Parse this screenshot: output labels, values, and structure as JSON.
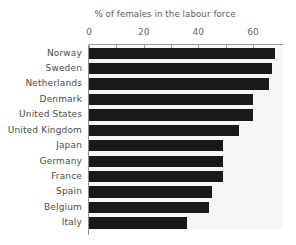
{
  "chart_data": {
    "type": "bar",
    "orientation": "horizontal",
    "title": "% of females in the labour force",
    "xlabel": "",
    "ylabel": "",
    "categories": [
      "Norway",
      "Sweden",
      "Netherlands",
      "Denmark",
      "United States",
      "United Kingdom",
      "Japan",
      "Germany",
      "France",
      "Spain",
      "Belgium",
      "Italy"
    ],
    "values": [
      68,
      67,
      66,
      60,
      60,
      55,
      49,
      49,
      49,
      45,
      44,
      36
    ],
    "xlim": [
      0,
      71
    ],
    "xticks": [
      0,
      20,
      40,
      60
    ],
    "xtick_labels": [
      "0",
      "20",
      "40",
      "60"
    ],
    "minor_xticks": [
      10,
      30,
      50
    ],
    "grid": false,
    "legend": null,
    "bar_color": "#191919",
    "plot_background": "#f6f6f6",
    "axis_color": "#9a9a9a"
  }
}
